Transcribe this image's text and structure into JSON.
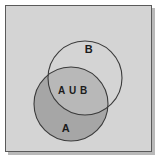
{
  "figure": {
    "kind": "venn-diagram",
    "canvas": {
      "width": 160,
      "height": 160,
      "background": "#ffffff"
    },
    "frame": {
      "name": "diagram-frame",
      "x": 5,
      "y": 5,
      "width": 147,
      "height": 147,
      "fill": "#d4d4d4",
      "stroke": "#5a5a5a",
      "stroke_width": 1,
      "shadow_color": "#b9b9b9"
    },
    "circles": [
      {
        "name": "circle-b",
        "set": "B",
        "cx": 85,
        "cy": 78,
        "r": 37,
        "fill": "none",
        "stroke": "#3b3b3b",
        "stroke_width": 1.1
      },
      {
        "name": "circle-a",
        "set": "A",
        "cx": 71,
        "cy": 104,
        "r": 37,
        "fill": "#a6a6a6",
        "stroke": "#3b3b3b",
        "stroke_width": 1.1
      }
    ],
    "regions": [
      {
        "name": "region-a-only",
        "label": "A",
        "fill": "#a6a6a6",
        "description": "Part of circle A outside circle B"
      },
      {
        "name": "region-intersection",
        "label": "A U B",
        "fill": "#b8b8b8",
        "description": "Overlap of circle A and circle B"
      },
      {
        "name": "region-b-only",
        "label": "B",
        "fill": "#d4d4d4",
        "description": "Part of circle B outside circle A"
      }
    ],
    "labels": [
      {
        "name": "label-b",
        "text": "B",
        "x": 89,
        "y": 53,
        "font_size": 11
      },
      {
        "name": "label-union",
        "text": "A U B",
        "x": 73,
        "y": 94,
        "font_size": 10
      },
      {
        "name": "label-a",
        "text": "A",
        "x": 66,
        "y": 132,
        "font_size": 11
      }
    ]
  }
}
